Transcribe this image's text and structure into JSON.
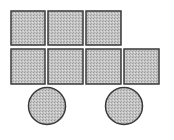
{
  "figure": {
    "fill_color": "#b8b8b8",
    "stroke_color": "#3a3a3a",
    "background": "#ffffff",
    "squares": [
      {
        "x": 11,
        "y": 11,
        "w": 34,
        "h": 34
      },
      {
        "x": 48,
        "y": 11,
        "w": 35,
        "h": 34
      },
      {
        "x": 86,
        "y": 11,
        "w": 35,
        "h": 34
      },
      {
        "x": 11,
        "y": 49,
        "w": 34,
        "h": 35
      },
      {
        "x": 48,
        "y": 49,
        "w": 35,
        "h": 35
      },
      {
        "x": 86,
        "y": 49,
        "w": 35,
        "h": 35
      },
      {
        "x": 124,
        "y": 49,
        "w": 35,
        "h": 35
      }
    ],
    "circles": [
      {
        "cx": 47,
        "cy": 106,
        "r": 18.5
      },
      {
        "cx": 124,
        "cy": 106,
        "r": 18.5
      }
    ]
  }
}
